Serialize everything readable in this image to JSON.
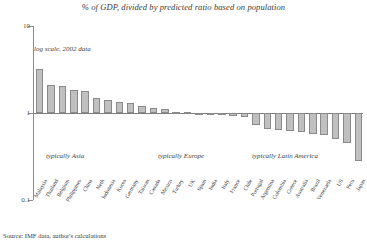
{
  "chart_data": {
    "type": "bar",
    "title": "% of GDP, divided by predicted ratio based on population",
    "xlabel": "",
    "ylabel": "",
    "yscale": "log",
    "ylim": [
      0.1,
      10
    ],
    "yticks": [
      10,
      1,
      0.1
    ],
    "ytick_labels": [
      "10",
      "1",
      "0.1"
    ],
    "grid": false,
    "legend": "none",
    "baseline": 1,
    "categories": [
      "Malaysia",
      "Thailand",
      "Belgium",
      "Philippines",
      "China",
      "Neth",
      "Indonesia",
      "Korea",
      "Germany",
      "Taiwan",
      "Canada",
      "Mexico",
      "Turkey",
      "UK",
      "Spain",
      "India",
      "Italy",
      "France",
      "Chile",
      "Portugal",
      "Argentina",
      "Colombia",
      "Greece",
      "Australia",
      "Brazil",
      "Venezuela",
      "US",
      "Peru",
      "Japan"
    ],
    "values": [
      3.2,
      2.1,
      2.05,
      1.85,
      1.8,
      1.5,
      1.42,
      1.35,
      1.3,
      1.2,
      1.15,
      1.1,
      1.04,
      1.02,
      1.0,
      0.98,
      0.95,
      0.92,
      0.9,
      0.72,
      0.66,
      0.64,
      0.62,
      0.6,
      0.58,
      0.56,
      0.5,
      0.45,
      0.28
    ],
    "annotations": [
      {
        "text": "log scale, 2002 data",
        "position": "upper-left"
      },
      {
        "text": "typically Asia",
        "position": "left-lower"
      },
      {
        "text": "typically Europe",
        "position": "center-lower"
      },
      {
        "text": "typically Latin America",
        "position": "right-lower"
      }
    ],
    "source": "Source: IMF data, author's calculations"
  },
  "notes": {
    "log_note": "log scale, 2002 data",
    "region_asia": "typically Asia",
    "region_europe": "typically Europe",
    "region_latam": "typically Latin America"
  },
  "colors": {
    "bar_fill": "#c0c0c0",
    "bar_border": "#8a8a8a",
    "axis": "#8d8d8d",
    "text": "#3a3a3a",
    "background": "#ffffff"
  }
}
